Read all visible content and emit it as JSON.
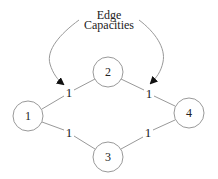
{
  "annotation": {
    "line1": "Edge",
    "line2": "Capacities"
  },
  "nodes": [
    {
      "id": "1",
      "label": "1",
      "cx": 28,
      "cy": 116
    },
    {
      "id": "2",
      "label": "2",
      "cx": 108,
      "cy": 72
    },
    {
      "id": "3",
      "label": "3",
      "cx": 108,
      "cy": 157
    },
    {
      "id": "4",
      "label": "4",
      "cx": 189,
      "cy": 113
    }
  ],
  "edges": [
    {
      "from": "1",
      "to": "2",
      "capacity": "1"
    },
    {
      "from": "2",
      "to": "4",
      "capacity": "1"
    },
    {
      "from": "1",
      "to": "3",
      "capacity": "1"
    },
    {
      "from": "3",
      "to": "4",
      "capacity": "1"
    }
  ],
  "colors": {
    "stroke": "#999999",
    "text": "#222222",
    "arrow": "#111111"
  }
}
